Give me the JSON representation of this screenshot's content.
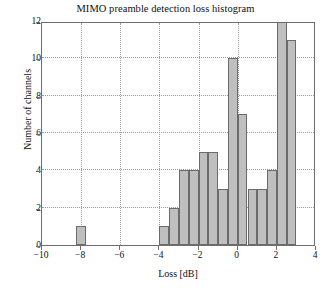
{
  "chart_data": {
    "type": "bar",
    "title": "MIMO preamble detection loss histogram",
    "xlabel": "Loss [dB]",
    "ylabel": "Number of channels",
    "xlim": [
      -10,
      4
    ],
    "ylim": [
      0,
      12
    ],
    "xticks": [
      -10,
      -8,
      -6,
      -4,
      -2,
      0,
      2,
      4
    ],
    "xtick_labels": [
      "−10",
      "−8",
      "−6",
      "−4",
      "−2",
      "0",
      "2",
      "4"
    ],
    "yticks": [
      0,
      2,
      4,
      6,
      8,
      10,
      12
    ],
    "ytick_labels": [
      "0",
      "2",
      "4",
      "6",
      "8",
      "10",
      "12"
    ],
    "grid": true,
    "grid_style": "dotted",
    "bin_width": 0.5,
    "bar_color": "#bfbfbf",
    "bar_edge_color": "#6b6b6b",
    "bins": [
      {
        "left": -8.25,
        "right": -7.75,
        "center": -8.0,
        "value": 1
      },
      {
        "left": -4.0,
        "right": -3.5,
        "center": -3.75,
        "value": 1
      },
      {
        "left": -3.5,
        "right": -3.0,
        "center": -3.25,
        "value": 2
      },
      {
        "left": -3.0,
        "right": -2.5,
        "center": -2.75,
        "value": 4
      },
      {
        "left": -2.5,
        "right": -2.0,
        "center": -2.25,
        "value": 4
      },
      {
        "left": -2.0,
        "right": -1.5,
        "center": -1.75,
        "value": 5
      },
      {
        "left": -1.5,
        "right": -1.0,
        "center": -1.25,
        "value": 5
      },
      {
        "left": -1.0,
        "right": -0.5,
        "center": -0.75,
        "value": 3
      },
      {
        "left": -0.5,
        "right": 0.0,
        "center": -0.25,
        "value": 10
      },
      {
        "left": 0.0,
        "right": 0.5,
        "center": 0.25,
        "value": 7
      },
      {
        "left": 0.5,
        "right": 1.0,
        "center": 0.75,
        "value": 3
      },
      {
        "left": 1.0,
        "right": 1.5,
        "center": 1.25,
        "value": 3
      },
      {
        "left": 1.5,
        "right": 2.0,
        "center": 1.75,
        "value": 4
      },
      {
        "left": 2.0,
        "right": 2.5,
        "center": 2.25,
        "value": 12
      },
      {
        "left": 2.5,
        "right": 3.0,
        "center": 2.75,
        "value": 11
      }
    ]
  }
}
